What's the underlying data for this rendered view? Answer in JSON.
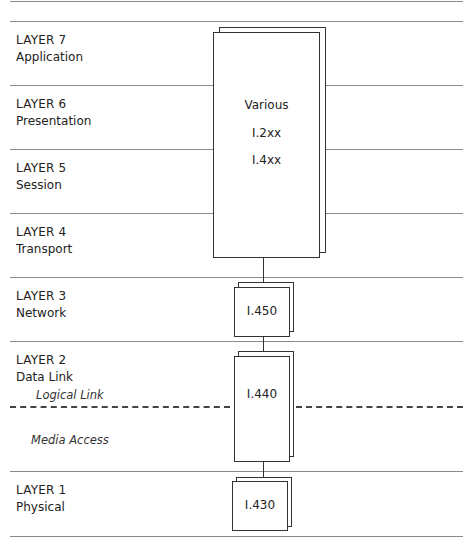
{
  "diagram": {
    "type": "osi-layer-mapping",
    "layers": [
      {
        "num": "LAYER 7",
        "name": "Application"
      },
      {
        "num": "LAYER 6",
        "name": "Presentation"
      },
      {
        "num": "LAYER 5",
        "name": "Session"
      },
      {
        "num": "LAYER 4",
        "name": "Transport"
      },
      {
        "num": "LAYER 3",
        "name": "Network"
      },
      {
        "num": "LAYER 2",
        "name": "Data Link"
      },
      {
        "num": "LAYER 1",
        "name": "Physical"
      }
    ],
    "sublayers": {
      "logical_link": "Logical Link",
      "media_access": "Media Access"
    },
    "boxes": {
      "upper": {
        "line1": "Various",
        "line2": "I.2xx",
        "line3": "I.4xx"
      },
      "network": "I.450",
      "datalink": "I.440",
      "physical": "I.430"
    },
    "colors": {
      "line": "#8a8a8a",
      "box_border": "#333333",
      "text": "#222222"
    }
  }
}
